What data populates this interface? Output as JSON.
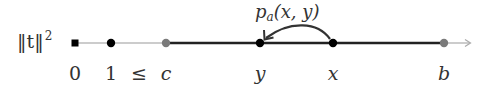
{
  "diagram": {
    "axis_label": {
      "base": "‖t‖",
      "exponent": "2"
    },
    "points": [
      {
        "id": "zero",
        "label": "0",
        "x": 75,
        "marker": "square",
        "color": "#000000",
        "italic": false
      },
      {
        "id": "one",
        "label": "1",
        "x": 111,
        "marker": "dot",
        "color": "#000000",
        "italic": false
      },
      {
        "id": "leq",
        "label": "≤",
        "x": 139,
        "marker": "none",
        "color": "#000000",
        "italic": false
      },
      {
        "id": "c",
        "label": "c",
        "x": 166,
        "marker": "dot",
        "color": "#7a7a7a",
        "italic": true
      },
      {
        "id": "y",
        "label": "y",
        "x": 260,
        "marker": "dot",
        "color": "#000000",
        "italic": true
      },
      {
        "id": "x",
        "label": "x",
        "x": 333,
        "marker": "dot",
        "color": "#000000",
        "italic": true
      },
      {
        "id": "b",
        "label": "b",
        "x": 444,
        "marker": "dot",
        "color": "#7a7a7a",
        "italic": true
      }
    ],
    "jump_arrow": {
      "from": "x",
      "to": "y",
      "label_func": "p",
      "label_sub": "a",
      "label_args": "(x, y)"
    },
    "colors": {
      "thin_line": "#999999",
      "thick_line": "#222222",
      "gray_point": "#7a7a7a",
      "arrow_tip": "#aaaaaa"
    }
  }
}
